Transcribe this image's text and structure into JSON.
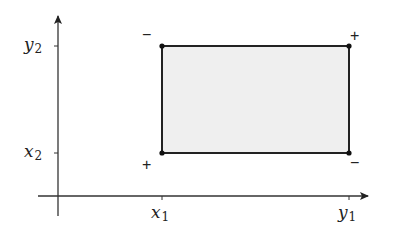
{
  "diagram": {
    "axes": {
      "x_ticks": [
        {
          "var": "x",
          "sub": "1"
        },
        {
          "var": "y",
          "sub": "1"
        }
      ],
      "y_ticks": [
        {
          "var": "y",
          "sub": "2"
        },
        {
          "var": "x",
          "sub": "2"
        }
      ]
    },
    "rectangle": {
      "fill_color": "#efefef",
      "stroke_color": "#222222"
    },
    "corner_signs": {
      "top_left": "−",
      "top_right": "+",
      "bottom_left": "+",
      "bottom_right": "−"
    }
  }
}
